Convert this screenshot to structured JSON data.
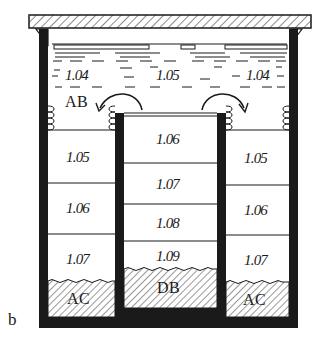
{
  "figure": {
    "panel_label": "b",
    "colors": {
      "ink": "#1a1a1a",
      "background": "#ffffff"
    },
    "top_water": {
      "values": [
        "1.04",
        "1.05",
        "1.04"
      ]
    },
    "labels": {
      "left_top": "AB",
      "left_bottom": "AC",
      "center_bottom": "DB",
      "right_bottom": "AC"
    },
    "left_chamber": {
      "layers": [
        "1.05",
        "1.06",
        "1.07"
      ]
    },
    "center_chamber": {
      "layers": [
        "1.06",
        "1.07",
        "1.08",
        "1.09"
      ]
    },
    "right_chamber": {
      "layers": [
        "1.05",
        "1.06",
        "1.07"
      ]
    }
  }
}
